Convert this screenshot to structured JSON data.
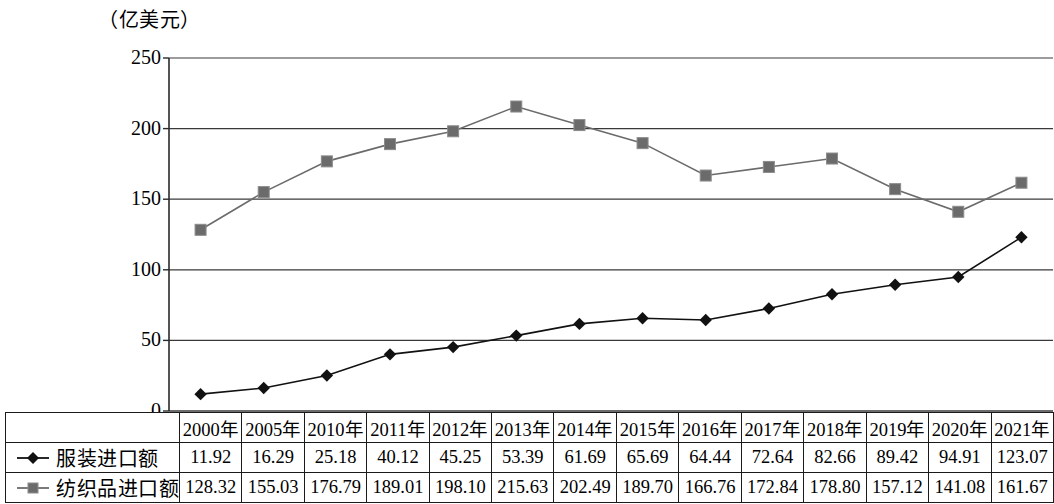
{
  "chart_data": {
    "type": "line",
    "title": "（亿美元）",
    "unit_label": "（亿美元）",
    "xlabel": "",
    "ylabel": "",
    "ylim": [
      0,
      250
    ],
    "yticks": [
      0,
      50,
      100,
      150,
      200,
      250
    ],
    "ytick_labels": [
      "0",
      "50",
      "100",
      "150",
      "200",
      "250"
    ],
    "grid": true,
    "legend_position": "table-left",
    "categories": [
      "2000年",
      "2005年",
      "2010年",
      "2011年",
      "2012年",
      "2013年",
      "2014年",
      "2015年",
      "2016年",
      "2017年",
      "2018年",
      "2019年",
      "2020年",
      "2021年"
    ],
    "series": [
      {
        "name": "服装进口额",
        "marker": "diamond",
        "color": "#111111",
        "values": [
          11.92,
          16.29,
          25.18,
          40.12,
          45.25,
          53.39,
          61.69,
          65.69,
          64.44,
          72.64,
          82.66,
          89.42,
          94.91,
          123.07
        ],
        "value_labels": [
          "11.92",
          "16.29",
          "25.18",
          "40.12",
          "45.25",
          "53.39",
          "61.69",
          "65.69",
          "64.44",
          "72.64",
          "82.66",
          "89.42",
          "94.91",
          "123.07"
        ]
      },
      {
        "name": "纺织品进口额",
        "marker": "square",
        "color": "#6b6b6b",
        "values": [
          128.32,
          155.03,
          176.79,
          189.01,
          198.1,
          215.63,
          202.49,
          189.7,
          166.76,
          172.84,
          178.8,
          157.12,
          141.08,
          161.67
        ],
        "value_labels": [
          "128.32",
          "155.03",
          "176.79",
          "189.01",
          "198.10",
          "215.63",
          "202.49",
          "189.70",
          "166.76",
          "172.84",
          "178.80",
          "157.12",
          "141.08",
          "161.67"
        ]
      }
    ]
  },
  "table": {
    "corner_label": "",
    "header": [
      "2000年",
      "2005年",
      "2010年",
      "2011年",
      "2012年",
      "2013年",
      "2014年",
      "2015年",
      "2016年",
      "2017年",
      "2018年",
      "2019年",
      "2020年",
      "2021年"
    ],
    "rows": [
      {
        "label": "服装进口额",
        "marker": "diamond",
        "cells": [
          "11.92",
          "16.29",
          "25.18",
          "40.12",
          "45.25",
          "53.39",
          "61.69",
          "65.69",
          "64.44",
          "72.64",
          "82.66",
          "89.42",
          "94.91",
          "123.07"
        ]
      },
      {
        "label": "纺织品进口额",
        "marker": "square",
        "cells": [
          "128.32",
          "155.03",
          "176.79",
          "189.01",
          "198.10",
          "215.63",
          "202.49",
          "189.70",
          "166.76",
          "172.84",
          "178.80",
          "157.12",
          "141.08",
          "161.67"
        ]
      }
    ]
  }
}
